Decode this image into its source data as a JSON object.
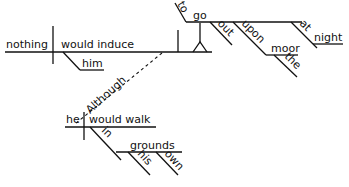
{
  "diagram": {
    "type": "Reed-Kellogg sentence diagram",
    "main_clause": {
      "subject": "nothing",
      "verb": "would induce",
      "object": "him",
      "infinitive_phrase": {
        "label": "to",
        "verb": "go",
        "modifiers": [
          "out",
          "upon",
          "at"
        ],
        "upon_object": "moor",
        "upon_object_modifier": "the",
        "at_object": "night"
      }
    },
    "connector": "Although",
    "subordinate_clause": {
      "subject": "he",
      "verb": "would walk",
      "preposition": "in",
      "prep_object": "grounds",
      "prep_object_modifiers": [
        "his",
        "own"
      ]
    }
  }
}
